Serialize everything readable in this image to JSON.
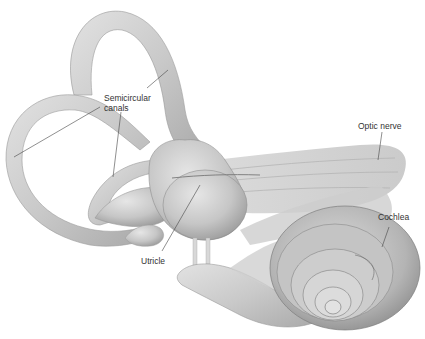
{
  "figure": {
    "labels": {
      "semicircular_line1": "Semicircular",
      "semicircular_line2": "canals",
      "optic_nerve": "Optic nerve",
      "cochlea": "Cochlea",
      "utricle": "Utricle"
    },
    "colors": {
      "background": "#ffffff",
      "structure_fill": "#cfcfcf",
      "structure_shade": "#a8a8a8",
      "structure_highlight": "#e4e4e4",
      "leader_line": "#444444",
      "label_text": "#333333"
    }
  }
}
